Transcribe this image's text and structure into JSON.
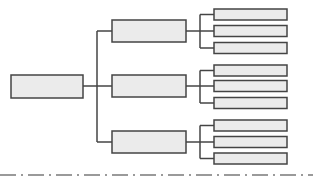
{
  "diagram": {
    "type": "tree",
    "colors": {
      "box_fill": "#ebebeb",
      "box_stroke": "#444444",
      "connector": "#444444",
      "divider": "#9a9a9a",
      "background": "#ffffff"
    },
    "root": {
      "label": "",
      "children": [
        {
          "label": "",
          "children": [
            {
              "label": ""
            },
            {
              "label": ""
            },
            {
              "label": ""
            }
          ]
        },
        {
          "label": "",
          "children": [
            {
              "label": ""
            },
            {
              "label": ""
            },
            {
              "label": ""
            }
          ]
        },
        {
          "label": "",
          "children": [
            {
              "label": ""
            },
            {
              "label": ""
            },
            {
              "label": ""
            }
          ]
        }
      ]
    },
    "divider_style": "dash-dot"
  }
}
